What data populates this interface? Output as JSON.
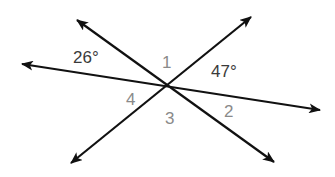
{
  "diagram": {
    "intersection": {
      "x": 168,
      "y": 87
    },
    "colors": {
      "line": "#111111",
      "given_label": "#3a3a3a",
      "unknown_label": "#8a8a8a",
      "background": "#ffffff"
    },
    "lines": [
      {
        "name": "line-a",
        "from": {
          "x": 22,
          "y": 64
        },
        "to": {
          "x": 320,
          "y": 110
        }
      },
      {
        "name": "line-b",
        "from": {
          "x": 77,
          "y": 20
        },
        "to": {
          "x": 274,
          "y": 162
        }
      },
      {
        "name": "line-c",
        "from": {
          "x": 71,
          "y": 163
        },
        "to": {
          "x": 251,
          "y": 17
        }
      }
    ],
    "labels": {
      "angle_26": {
        "text": "26°",
        "x": 73,
        "y": 63
      },
      "angle_1": {
        "text": "1",
        "x": 162,
        "y": 68
      },
      "angle_47": {
        "text": "47°",
        "x": 211,
        "y": 77
      },
      "angle_4": {
        "text": "4",
        "x": 126,
        "y": 105
      },
      "angle_3": {
        "text": "3",
        "x": 165,
        "y": 124
      },
      "angle_2": {
        "text": "2",
        "x": 224,
        "y": 117
      }
    }
  }
}
